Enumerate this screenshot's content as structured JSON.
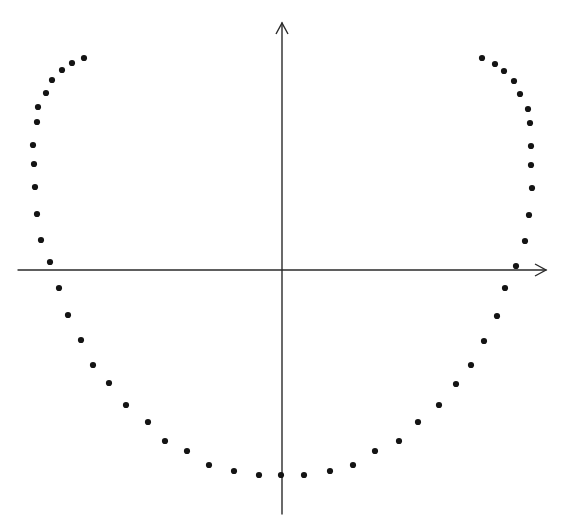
{
  "figure": {
    "width": 564,
    "height": 525,
    "background": "#ffffff",
    "axis_color": "#2a2a2a",
    "dot_color": "#141414",
    "dot_radius": 3.1
  },
  "axes": {
    "x_axis": {
      "x1": 18,
      "y1": 270,
      "x2": 546,
      "y2": 270,
      "arrow": "right"
    },
    "y_axis": {
      "x1": 282,
      "y1": 514,
      "x2": 282,
      "y2": 23,
      "arrow": "up"
    }
  },
  "chart_data": {
    "type": "scatter",
    "title": "",
    "xlabel": "",
    "ylabel": "",
    "grid": false,
    "legend": null,
    "origin_px": [
      282,
      270
    ],
    "series": [
      {
        "name": "left-arm",
        "points": [
          [
            84,
            58
          ],
          [
            72,
            63
          ],
          [
            62,
            70
          ],
          [
            52,
            80
          ],
          [
            46,
            93
          ],
          [
            38,
            107
          ],
          [
            37,
            122
          ],
          [
            33,
            145
          ],
          [
            34,
            164
          ],
          [
            35,
            187
          ],
          [
            37,
            214
          ],
          [
            41,
            240
          ],
          [
            50,
            262
          ]
        ]
      },
      {
        "name": "bottom-left",
        "points": [
          [
            59,
            288
          ],
          [
            68,
            315
          ],
          [
            81,
            340
          ],
          [
            93,
            365
          ],
          [
            109,
            383
          ],
          [
            126,
            405
          ],
          [
            148,
            422
          ],
          [
            165,
            441
          ],
          [
            187,
            451
          ],
          [
            209,
            465
          ],
          [
            234,
            471
          ],
          [
            259,
            475
          ]
        ]
      },
      {
        "name": "bottom-center",
        "points": [
          [
            281,
            475
          ]
        ]
      },
      {
        "name": "bottom-right",
        "points": [
          [
            304,
            475
          ],
          [
            330,
            471
          ],
          [
            353,
            465
          ],
          [
            375,
            451
          ],
          [
            399,
            441
          ],
          [
            418,
            422
          ],
          [
            439,
            405
          ],
          [
            456,
            384
          ],
          [
            471,
            365
          ],
          [
            484,
            341
          ],
          [
            497,
            316
          ],
          [
            505,
            288
          ]
        ]
      },
      {
        "name": "right-arm",
        "points": [
          [
            516,
            266
          ],
          [
            525,
            241
          ],
          [
            529,
            215
          ],
          [
            532,
            188
          ],
          [
            531,
            165
          ],
          [
            531,
            146
          ],
          [
            530,
            123
          ],
          [
            528,
            109
          ],
          [
            520,
            94
          ],
          [
            514,
            81
          ],
          [
            504,
            71
          ],
          [
            495,
            64
          ],
          [
            482,
            58
          ]
        ]
      }
    ]
  }
}
